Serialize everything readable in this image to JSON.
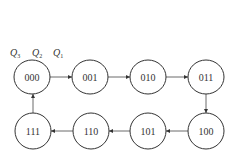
{
  "diagram": {
    "type": "state-transition",
    "bit_labels": [
      {
        "name": "Q",
        "sub": "3"
      },
      {
        "name": "Q",
        "sub": "2"
      },
      {
        "name": "Q",
        "sub": "1"
      }
    ],
    "states": [
      {
        "id": "s000",
        "label": "000",
        "cx": 32,
        "cy": 77
      },
      {
        "id": "s001",
        "label": "001",
        "cx": 90,
        "cy": 77
      },
      {
        "id": "s010",
        "label": "010",
        "cx": 148,
        "cy": 77
      },
      {
        "id": "s011",
        "label": "011",
        "cx": 206,
        "cy": 77
      },
      {
        "id": "s100",
        "label": "100",
        "cx": 206,
        "cy": 131
      },
      {
        "id": "s101",
        "label": "101",
        "cx": 148,
        "cy": 131
      },
      {
        "id": "s110",
        "label": "110",
        "cx": 91,
        "cy": 131
      },
      {
        "id": "s111",
        "label": "111",
        "cx": 33,
        "cy": 131
      }
    ],
    "transitions": [
      {
        "from": "000",
        "to": "001"
      },
      {
        "from": "001",
        "to": "010"
      },
      {
        "from": "010",
        "to": "011"
      },
      {
        "from": "011",
        "to": "100"
      },
      {
        "from": "100",
        "to": "101"
      },
      {
        "from": "101",
        "to": "110"
      },
      {
        "from": "110",
        "to": "111"
      },
      {
        "from": "111",
        "to": "000"
      }
    ]
  }
}
